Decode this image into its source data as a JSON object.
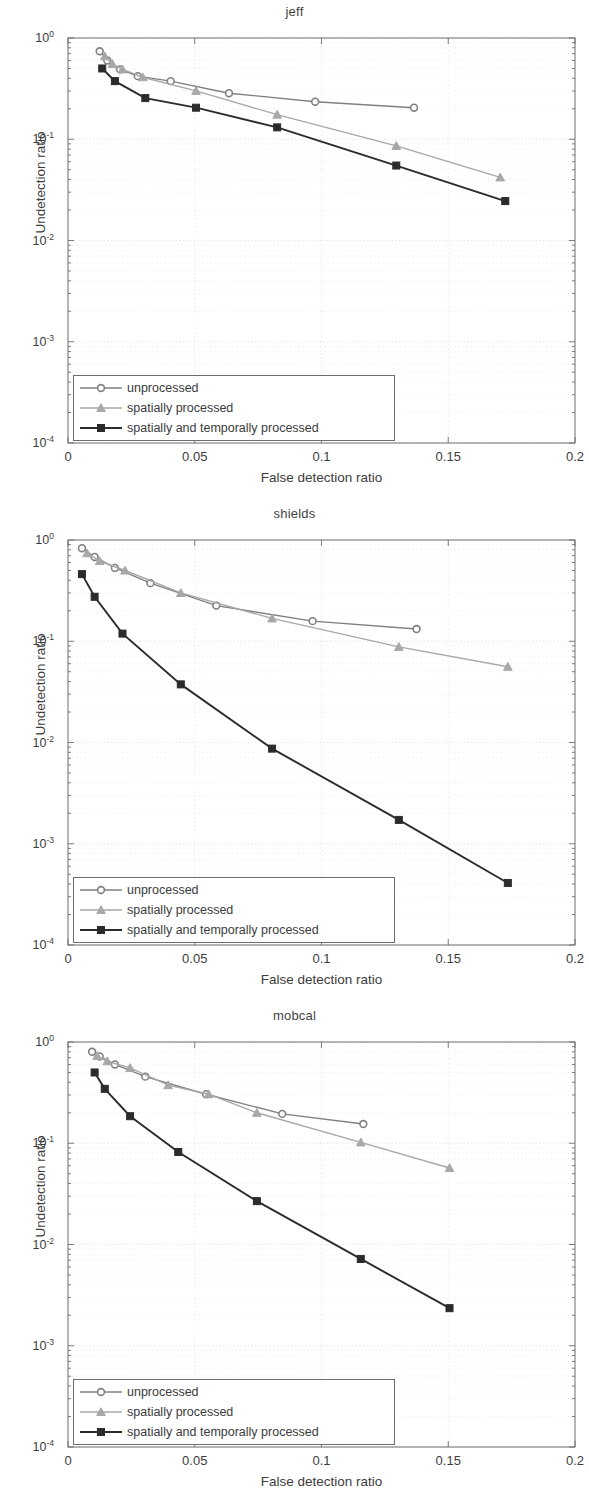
{
  "figure": {
    "axis": {
      "xlabel": "False detection ratio",
      "ylabel": "Undetection ratio",
      "xticks": [
        "0",
        "0.05",
        "0.1",
        "0.15",
        "0.2"
      ],
      "xlim": [
        0,
        0.2
      ],
      "ylim": [
        0.0001,
        1
      ],
      "yticks": [
        "10",
        "10",
        "10",
        "10",
        "10"
      ],
      "yexps": [
        "0",
        "-1",
        "-2",
        "-3",
        "-4"
      ],
      "grid": "minor dotted, log-y"
    },
    "legend": {
      "items": [
        {
          "label": "unprocessed",
          "marker": "circle",
          "color": "#808080"
        },
        {
          "label": "spatially processed",
          "marker": "triangle",
          "color": "#a8a8a8"
        },
        {
          "label": "spatially and temporally processed",
          "marker": "square",
          "color": "#2b2b2b"
        }
      ]
    },
    "colors": {
      "unprocessed": "#808080",
      "spatially_processed": "#a8a8a8",
      "spatially_and_temporally_processed": "#2b2b2b",
      "axis": "#6e6e6e",
      "grid": "#d9c8c8",
      "text": "#3c3c3c"
    }
  },
  "chart_data": [
    {
      "type": "line",
      "title": "jeff",
      "xlabel": "False detection ratio",
      "ylabel": "Undetection ratio",
      "xlim": [
        0,
        0.2
      ],
      "ylim": [
        0.0001,
        1
      ],
      "yscale": "log",
      "grid": true,
      "legend_position": "lower-left",
      "series": [
        {
          "name": "unprocessed",
          "marker": "circle",
          "color": "#808080",
          "points": [
            {
              "x": 0.0125,
              "y": 0.74
            },
            {
              "x": 0.0155,
              "y": 0.6
            },
            {
              "x": 0.0205,
              "y": 0.49
            },
            {
              "x": 0.0275,
              "y": 0.42
            },
            {
              "x": 0.0405,
              "y": 0.375
            },
            {
              "x": 0.0635,
              "y": 0.285
            },
            {
              "x": 0.0975,
              "y": 0.235
            },
            {
              "x": 0.1365,
              "y": 0.205
            }
          ]
        },
        {
          "name": "spatially processed",
          "marker": "triangle",
          "color": "#a8a8a8",
          "points": [
            {
              "x": 0.0145,
              "y": 0.66
            },
            {
              "x": 0.0175,
              "y": 0.555
            },
            {
              "x": 0.0215,
              "y": 0.49
            },
            {
              "x": 0.0295,
              "y": 0.41
            },
            {
              "x": 0.0505,
              "y": 0.3
            },
            {
              "x": 0.0825,
              "y": 0.175
            },
            {
              "x": 0.1295,
              "y": 0.086
            },
            {
              "x": 0.1705,
              "y": 0.042
            }
          ]
        },
        {
          "name": "spatially and temporally processed",
          "marker": "square",
          "color": "#2b2b2b",
          "points": [
            {
              "x": 0.0135,
              "y": 0.5
            },
            {
              "x": 0.0185,
              "y": 0.375
            },
            {
              "x": 0.0305,
              "y": 0.255
            },
            {
              "x": 0.0505,
              "y": 0.205
            },
            {
              "x": 0.0825,
              "y": 0.131
            },
            {
              "x": 0.1295,
              "y": 0.055
            },
            {
              "x": 0.1725,
              "y": 0.0245
            }
          ]
        }
      ]
    },
    {
      "type": "line",
      "title": "shields",
      "xlabel": "False detection ratio",
      "ylabel": "Undetection ratio",
      "xlim": [
        0,
        0.2
      ],
      "ylim": [
        0.0001,
        1
      ],
      "yscale": "log",
      "grid": true,
      "legend_position": "lower-left",
      "series": [
        {
          "name": "unprocessed",
          "marker": "circle",
          "color": "#808080",
          "points": [
            {
              "x": 0.0055,
              "y": 0.83
            },
            {
              "x": 0.0105,
              "y": 0.68
            },
            {
              "x": 0.0185,
              "y": 0.53
            },
            {
              "x": 0.0325,
              "y": 0.375
            },
            {
              "x": 0.0585,
              "y": 0.225
            },
            {
              "x": 0.0965,
              "y": 0.158
            },
            {
              "x": 0.1375,
              "y": 0.132
            }
          ]
        },
        {
          "name": "spatially processed",
          "marker": "triangle",
          "color": "#a8a8a8",
          "points": [
            {
              "x": 0.0075,
              "y": 0.74
            },
            {
              "x": 0.0125,
              "y": 0.62
            },
            {
              "x": 0.0225,
              "y": 0.5
            },
            {
              "x": 0.0445,
              "y": 0.3
            },
            {
              "x": 0.0805,
              "y": 0.168
            },
            {
              "x": 0.1305,
              "y": 0.088
            },
            {
              "x": 0.1735,
              "y": 0.056
            }
          ]
        },
        {
          "name": "spatially and temporally processed",
          "marker": "square",
          "color": "#2b2b2b",
          "points": [
            {
              "x": 0.0055,
              "y": 0.46
            },
            {
              "x": 0.0105,
              "y": 0.275
            },
            {
              "x": 0.0215,
              "y": 0.119
            },
            {
              "x": 0.0445,
              "y": 0.0375
            },
            {
              "x": 0.0805,
              "y": 0.0087
            },
            {
              "x": 0.1305,
              "y": 0.00172
            },
            {
              "x": 0.1735,
              "y": 0.00041
            }
          ]
        }
      ]
    },
    {
      "type": "line",
      "title": "mobcal",
      "xlabel": "False detection ratio",
      "ylabel": "Undetection ratio",
      "xlim": [
        0,
        0.2
      ],
      "ylim": [
        0.0001,
        1
      ],
      "yscale": "log",
      "grid": true,
      "legend_position": "lower-left",
      "series": [
        {
          "name": "unprocessed",
          "marker": "circle",
          "color": "#808080",
          "points": [
            {
              "x": 0.0095,
              "y": 0.8
            },
            {
              "x": 0.0125,
              "y": 0.72
            },
            {
              "x": 0.0185,
              "y": 0.6
            },
            {
              "x": 0.0305,
              "y": 0.455
            },
            {
              "x": 0.0545,
              "y": 0.305
            },
            {
              "x": 0.0845,
              "y": 0.195
            },
            {
              "x": 0.1165,
              "y": 0.155
            }
          ]
        },
        {
          "name": "spatially processed",
          "marker": "triangle",
          "color": "#a8a8a8",
          "points": [
            {
              "x": 0.0115,
              "y": 0.73
            },
            {
              "x": 0.0155,
              "y": 0.645
            },
            {
              "x": 0.0245,
              "y": 0.555
            },
            {
              "x": 0.0395,
              "y": 0.375
            },
            {
              "x": 0.0555,
              "y": 0.305
            },
            {
              "x": 0.0745,
              "y": 0.2
            },
            {
              "x": 0.1155,
              "y": 0.102
            },
            {
              "x": 0.1505,
              "y": 0.057
            }
          ]
        },
        {
          "name": "spatially and temporally processed",
          "marker": "square",
          "color": "#2b2b2b",
          "points": [
            {
              "x": 0.0105,
              "y": 0.5
            },
            {
              "x": 0.0145,
              "y": 0.345
            },
            {
              "x": 0.0245,
              "y": 0.185
            },
            {
              "x": 0.0435,
              "y": 0.082
            },
            {
              "x": 0.0745,
              "y": 0.0268
            },
            {
              "x": 0.1155,
              "y": 0.0072
            },
            {
              "x": 0.1505,
              "y": 0.00235
            }
          ]
        }
      ]
    }
  ]
}
